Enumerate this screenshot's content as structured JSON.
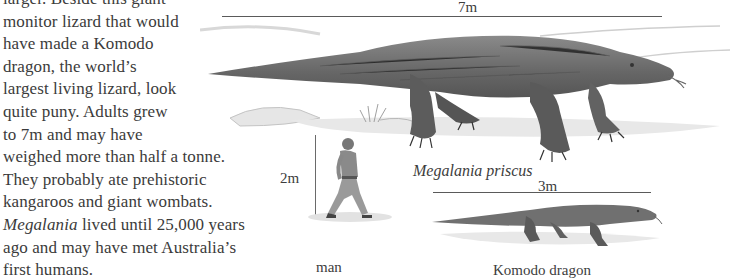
{
  "article": {
    "lines": [
      "larger. Beside this giant",
      "monitor lizard that would",
      "have made a Komodo",
      "dragon, the world’s",
      "largest living lizard, look",
      "quite puny. Adults grew",
      "to 7m and may have",
      "weighed more than half a tonne.",
      "They probably ate prehistoric",
      "kangaroos and giant wombats."
    ],
    "italic_lead": "Megalania",
    "line_11_rest": " lived until 25,000 years",
    "line_12": "ago and may have met Australia’s",
    "line_13": "first humans."
  },
  "figure": {
    "megalania": {
      "scale_label": "7m",
      "caption": "Megalania priscus"
    },
    "man": {
      "scale_label": "2m",
      "caption": "man"
    },
    "komodo": {
      "scale_label": "3m",
      "caption": "Komodo dragon"
    },
    "colors": {
      "text": "#3b3b3b",
      "scale_line": "#5a5a5a",
      "lizard": "#6f6f6f",
      "ground": "#d9d9d9"
    }
  }
}
